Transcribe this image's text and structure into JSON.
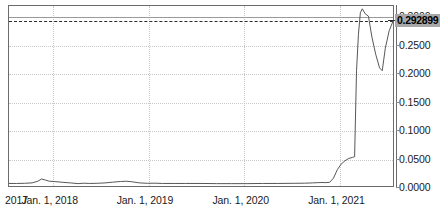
{
  "chart_data": {
    "type": "line",
    "title": "",
    "xlabel": "",
    "ylabel": "",
    "grid": true,
    "legend": null,
    "xlim": [
      "2017-01-01",
      "2021-09-01"
    ],
    "ylim": [
      0.0,
      0.32
    ],
    "y_ticks": [
      "0.3000",
      "0.2500",
      "0.2000",
      "0.1500",
      "0.1000",
      "0.0500",
      "0.0000"
    ],
    "y_tick_values": [
      0.3,
      0.25,
      0.2,
      0.15,
      0.1,
      0.05,
      0.0
    ],
    "x_ticks": [
      "2017",
      "Jan. 1, 2018",
      "Jan. 1, 2019",
      "Jan. 1, 2020",
      "Jan. 1, 2021"
    ],
    "current_price_label": "0.292899",
    "current_price_value": 0.292899,
    "reference_line_value": 0.292899,
    "top_level_line_value": 0.3,
    "line_color": "#555555",
    "grid_color": "#c9c9c9",
    "frame_color": "#6b6b6b",
    "price_tag_bg": "#a8a8a8",
    "series": [
      {
        "name": "price",
        "points": [
          [
            0.0,
            0.0045
          ],
          [
            0.02,
            0.0045
          ],
          [
            0.04,
            0.0048
          ],
          [
            0.06,
            0.0055
          ],
          [
            0.075,
            0.0085
          ],
          [
            0.085,
            0.0125
          ],
          [
            0.095,
            0.0105
          ],
          [
            0.105,
            0.0085
          ],
          [
            0.12,
            0.0078
          ],
          [
            0.14,
            0.0065
          ],
          [
            0.16,
            0.0055
          ],
          [
            0.18,
            0.0042
          ],
          [
            0.195,
            0.005
          ],
          [
            0.21,
            0.0045
          ],
          [
            0.23,
            0.0048
          ],
          [
            0.25,
            0.0055
          ],
          [
            0.27,
            0.0068
          ],
          [
            0.29,
            0.008
          ],
          [
            0.305,
            0.0085
          ],
          [
            0.32,
            0.0075
          ],
          [
            0.34,
            0.0055
          ],
          [
            0.36,
            0.0048
          ],
          [
            0.38,
            0.005
          ],
          [
            0.4,
            0.0045
          ],
          [
            0.43,
            0.0045
          ],
          [
            0.46,
            0.0045
          ],
          [
            0.5,
            0.0045
          ],
          [
            0.54,
            0.0042
          ],
          [
            0.58,
            0.0042
          ],
          [
            0.62,
            0.0042
          ],
          [
            0.66,
            0.0045
          ],
          [
            0.7,
            0.0045
          ],
          [
            0.74,
            0.0048
          ],
          [
            0.77,
            0.005
          ],
          [
            0.79,
            0.0055
          ],
          [
            0.805,
            0.006
          ],
          [
            0.815,
            0.0062
          ],
          [
            0.825,
            0.006
          ],
          [
            0.835,
            0.0065
          ],
          [
            0.845,
            0.014
          ],
          [
            0.855,
            0.029
          ],
          [
            0.865,
            0.039
          ],
          [
            0.875,
            0.045
          ],
          [
            0.885,
            0.049
          ],
          [
            0.895,
            0.051
          ],
          [
            0.9,
            0.052
          ],
          [
            0.905,
            0.205
          ],
          [
            0.91,
            0.27
          ],
          [
            0.915,
            0.308
          ],
          [
            0.92,
            0.315
          ],
          [
            0.928,
            0.306
          ],
          [
            0.936,
            0.302
          ],
          [
            0.945,
            0.265
          ],
          [
            0.955,
            0.234
          ],
          [
            0.965,
            0.21
          ],
          [
            0.972,
            0.205
          ],
          [
            0.98,
            0.245
          ],
          [
            0.99,
            0.276
          ],
          [
            1.0,
            0.2929
          ]
        ]
      }
    ]
  },
  "y_axis": {
    "labels": [
      {
        "text": "0.3000",
        "value": 0.3
      },
      {
        "text": "0.2500",
        "value": 0.25
      },
      {
        "text": "0.2000",
        "value": 0.2
      },
      {
        "text": "0.1500",
        "value": 0.15
      },
      {
        "text": "0.1000",
        "value": 0.1
      },
      {
        "text": "0.0500",
        "value": 0.05
      },
      {
        "text": "0.0000",
        "value": 0.0
      }
    ]
  },
  "x_axis": {
    "labels": [
      {
        "text": "2017",
        "pos": 0.0
      },
      {
        "text": "Jan. 1, 2018",
        "pos": 0.115
      },
      {
        "text": "Jan. 1, 2019",
        "pos": 0.362
      },
      {
        "text": "Jan. 1, 2020",
        "pos": 0.61
      },
      {
        "text": "Jan. 1, 2021",
        "pos": 0.858
      }
    ],
    "gridline_positions": [
      0.115,
      0.362,
      0.61,
      0.858
    ]
  },
  "price_tag": {
    "label": "0.292899"
  }
}
